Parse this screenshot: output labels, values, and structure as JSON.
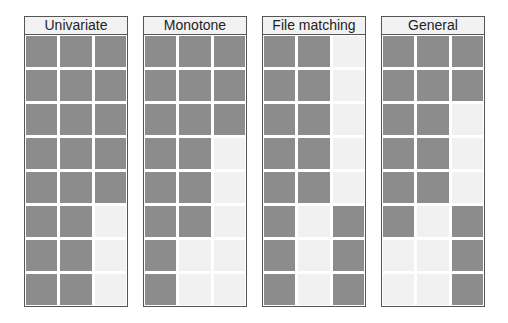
{
  "figure": {
    "panels": [
      {
        "title": "Univariate",
        "rows": [
          [
            1,
            1,
            1
          ],
          [
            1,
            1,
            1
          ],
          [
            1,
            1,
            1
          ],
          [
            1,
            1,
            1
          ],
          [
            1,
            1,
            1
          ],
          [
            1,
            1,
            0
          ],
          [
            1,
            1,
            0
          ],
          [
            1,
            1,
            0
          ]
        ]
      },
      {
        "title": "Monotone",
        "rows": [
          [
            1,
            1,
            1
          ],
          [
            1,
            1,
            1
          ],
          [
            1,
            1,
            1
          ],
          [
            1,
            1,
            0
          ],
          [
            1,
            1,
            0
          ],
          [
            1,
            1,
            0
          ],
          [
            1,
            0,
            0
          ],
          [
            1,
            0,
            0
          ]
        ]
      },
      {
        "title": "File matching",
        "rows": [
          [
            1,
            1,
            0
          ],
          [
            1,
            1,
            0
          ],
          [
            1,
            1,
            0
          ],
          [
            1,
            1,
            0
          ],
          [
            1,
            1,
            0
          ],
          [
            1,
            0,
            1
          ],
          [
            1,
            0,
            1
          ],
          [
            1,
            0,
            1
          ]
        ]
      },
      {
        "title": "General",
        "rows": [
          [
            1,
            1,
            1
          ],
          [
            1,
            1,
            1
          ],
          [
            1,
            1,
            0
          ],
          [
            1,
            1,
            0
          ],
          [
            1,
            1,
            0
          ],
          [
            1,
            0,
            1
          ],
          [
            0,
            0,
            1
          ],
          [
            0,
            0,
            1
          ]
        ]
      }
    ],
    "colors": {
      "observed": "#8c8c8c",
      "missing": "#f1f1f1",
      "border": "#555555"
    }
  }
}
